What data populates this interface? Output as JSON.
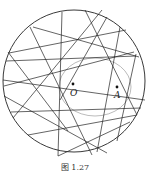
{
  "figure": {
    "caption": "图 1.27",
    "points": [
      {
        "label": "O",
        "x": 73,
        "y": 87
      },
      {
        "label": "A",
        "x": 117,
        "y": 87
      }
    ],
    "circle": {
      "cx": 74,
      "cy": 81,
      "r": 71
    },
    "envelope_ellipse": {
      "cx": 95,
      "cy": 87,
      "rx": 36,
      "ry": 29
    },
    "colors": {
      "stroke": "#222222",
      "ellipse": "#999999"
    }
  }
}
